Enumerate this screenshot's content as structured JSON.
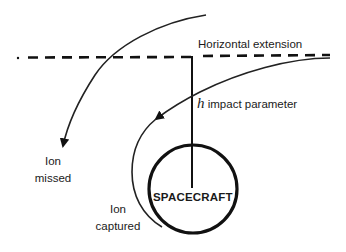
{
  "diagram": {
    "labels": {
      "horizontal_extension": "Horizontal extension",
      "h_symbol": "h",
      "impact_parameter": "impact parameter",
      "ion_missed_line1": "Ion",
      "ion_missed_line2": "missed",
      "ion_captured_line1": "Ion",
      "ion_captured_line2": "captured",
      "spacecraft": "SPACECRAFT"
    },
    "colors": {
      "stroke": "#111111",
      "background": "#ffffff"
    }
  }
}
